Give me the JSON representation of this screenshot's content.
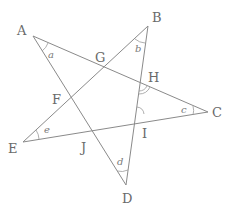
{
  "diagram": {
    "type": "star-pentagram",
    "vertices": {
      "A": {
        "label": "A",
        "x": 33,
        "y": 36
      },
      "B": {
        "label": "B",
        "x": 148,
        "y": 26
      },
      "C": {
        "label": "C",
        "x": 208,
        "y": 112
      },
      "D": {
        "label": "D",
        "x": 126,
        "y": 185
      },
      "E": {
        "label": "E",
        "x": 23,
        "y": 142
      }
    },
    "intersections": {
      "F": {
        "label": "F"
      },
      "G": {
        "label": "G"
      },
      "H": {
        "label": "H"
      },
      "I": {
        "label": "I"
      },
      "J": {
        "label": "J"
      }
    },
    "segments": [
      [
        "A",
        "C"
      ],
      [
        "A",
        "D"
      ],
      [
        "B",
        "E"
      ],
      [
        "B",
        "D"
      ],
      [
        "E",
        "C"
      ]
    ],
    "angle_labels": {
      "a": "a",
      "b": "b",
      "c": "c",
      "d": "d",
      "e": "e"
    },
    "marked_angles": [
      "angle at H (double arc)",
      "angle at I (single arc)"
    ]
  }
}
